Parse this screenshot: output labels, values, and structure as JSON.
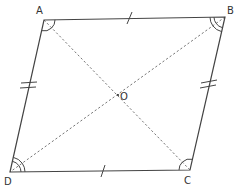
{
  "figure": {
    "type": "parallelogram (rhombus-like) with diagonals",
    "vertices": {
      "A": {
        "label": "A"
      },
      "B": {
        "label": "B"
      },
      "C": {
        "label": "C"
      },
      "D": {
        "label": "D"
      }
    },
    "center": {
      "label": "O"
    },
    "sides": {
      "AB": {
        "tick_marks": 1
      },
      "DC": {
        "tick_marks": 1
      },
      "AD": {
        "tick_marks": 2
      },
      "BC": {
        "tick_marks": 2
      }
    },
    "diagonals": [
      "AC",
      "BD"
    ],
    "diagonal_style": "dashed",
    "angle_marks": {
      "A": {
        "arcs": 1
      },
      "C": {
        "arcs": 1
      },
      "B": {
        "arcs": 2
      },
      "D": {
        "arcs": 2
      }
    },
    "colors": {
      "line": "#444444",
      "dashed": "#777777",
      "text": "#333333",
      "background": "#ffffff"
    }
  }
}
